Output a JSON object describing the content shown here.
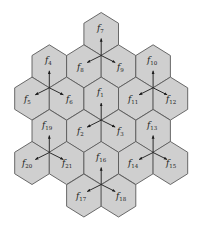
{
  "diagram": {
    "type": "hexagonal cell cluster with frequency reuse",
    "colors": {
      "cell_fill": "#cfcfcf",
      "cell_stroke": "#5a5a5a",
      "arrow": "#1a1a1a",
      "background": "#ffffff"
    },
    "cells": [
      {
        "id": "f7",
        "label": "f",
        "sub": "7",
        "row": 1,
        "cx": 101.2,
        "cy": 34.0
      },
      {
        "id": "f4",
        "label": "f",
        "sub": "4",
        "row": 2,
        "cx": 49.3,
        "cy": 66.3
      },
      {
        "id": "f8",
        "label": "f",
        "sub": "8",
        "row": 2,
        "cx": 83.9,
        "cy": 66.3
      },
      {
        "id": "f9",
        "label": "f",
        "sub": "9",
        "row": 2,
        "cx": 118.5,
        "cy": 66.3
      },
      {
        "id": "f10",
        "label": "f",
        "sub": "10",
        "row": 2,
        "cx": 153.1,
        "cy": 66.3
      },
      {
        "id": "f5",
        "label": "f",
        "sub": "5",
        "row": 3,
        "cx": 32.0,
        "cy": 98.6
      },
      {
        "id": "f6",
        "label": "f",
        "sub": "6",
        "row": 3,
        "cx": 66.6,
        "cy": 98.6
      },
      {
        "id": "f1",
        "label": "f",
        "sub": "1",
        "row": 3,
        "cx": 101.2,
        "cy": 98.6
      },
      {
        "id": "f11",
        "label": "f",
        "sub": "11",
        "row": 3,
        "cx": 135.8,
        "cy": 98.6
      },
      {
        "id": "f12",
        "label": "f",
        "sub": "12",
        "row": 3,
        "cx": 170.4,
        "cy": 98.6
      },
      {
        "id": "f19",
        "label": "f",
        "sub": "19",
        "row": 4,
        "cx": 49.3,
        "cy": 131.0
      },
      {
        "id": "f2",
        "label": "f",
        "sub": "2",
        "row": 4,
        "cx": 83.9,
        "cy": 131.0
      },
      {
        "id": "f3",
        "label": "f",
        "sub": "3",
        "row": 4,
        "cx": 118.5,
        "cy": 131.0
      },
      {
        "id": "f13",
        "label": "f",
        "sub": "13",
        "row": 4,
        "cx": 153.1,
        "cy": 131.0
      },
      {
        "id": "f20",
        "label": "f",
        "sub": "20",
        "row": 5,
        "cx": 32.0,
        "cy": 163.0
      },
      {
        "id": "f21",
        "label": "f",
        "sub": "21",
        "row": 5,
        "cx": 66.6,
        "cy": 163.0
      },
      {
        "id": "f16",
        "label": "f",
        "sub": "16",
        "row": 5,
        "cx": 101.2,
        "cy": 163.0
      },
      {
        "id": "f14",
        "label": "f",
        "sub": "14",
        "row": 5,
        "cx": 135.8,
        "cy": 163.0
      },
      {
        "id": "f15",
        "label": "f",
        "sub": "15",
        "row": 5,
        "cx": 170.4,
        "cy": 163.0
      },
      {
        "id": "f17",
        "label": "f",
        "sub": "17",
        "row": 6,
        "cx": 83.9,
        "cy": 195.5
      },
      {
        "id": "f18",
        "label": "f",
        "sub": "18",
        "row": 6,
        "cx": 118.5,
        "cy": 195.5
      }
    ],
    "sites": [
      {
        "name": "site-f7",
        "x": 101.2,
        "y": 55.5,
        "sectors": [
          "f7",
          "f8",
          "f9"
        ]
      },
      {
        "name": "site-f4",
        "x": 49.3,
        "y": 87.8,
        "sectors": [
          "f4",
          "f5",
          "f6"
        ]
      },
      {
        "name": "site-f10",
        "x": 153.1,
        "y": 87.8,
        "sectors": [
          "f10",
          "f11",
          "f12"
        ]
      },
      {
        "name": "site-f1",
        "x": 101.2,
        "y": 120.1,
        "sectors": [
          "f1",
          "f2",
          "f3"
        ]
      },
      {
        "name": "site-f19",
        "x": 49.3,
        "y": 152.5,
        "sectors": [
          "f19",
          "f20",
          "f21"
        ]
      },
      {
        "name": "site-f13",
        "x": 153.1,
        "y": 152.5,
        "sectors": [
          "f13",
          "f14",
          "f15"
        ]
      },
      {
        "name": "site-f16",
        "x": 101.2,
        "y": 184.5,
        "sectors": [
          "f16",
          "f17",
          "f18"
        ]
      }
    ],
    "labels": {
      "f1": {
        "x": 97,
        "y": 95
      },
      "f2": {
        "x": 77,
        "y": 134
      },
      "f3": {
        "x": 117,
        "y": 134
      },
      "f4": {
        "x": 45,
        "y": 63
      },
      "f5": {
        "x": 24,
        "y": 102
      },
      "f6": {
        "x": 66,
        "y": 102
      },
      "f7": {
        "x": 97,
        "y": 31
      },
      "f8": {
        "x": 77,
        "y": 70
      },
      "f9": {
        "x": 117,
        "y": 70
      },
      "f10": {
        "x": 147,
        "y": 63
      },
      "f11": {
        "x": 128,
        "y": 102
      },
      "f12": {
        "x": 166,
        "y": 102
      },
      "f13": {
        "x": 147,
        "y": 128
      },
      "f14": {
        "x": 128,
        "y": 166
      },
      "f15": {
        "x": 166,
        "y": 166
      },
      "f16": {
        "x": 96,
        "y": 160
      },
      "f17": {
        "x": 76,
        "y": 199
      },
      "f18": {
        "x": 116,
        "y": 199
      },
      "f19": {
        "x": 42,
        "y": 128
      },
      "f20": {
        "x": 22,
        "y": 166
      },
      "f21": {
        "x": 62,
        "y": 166
      }
    }
  }
}
